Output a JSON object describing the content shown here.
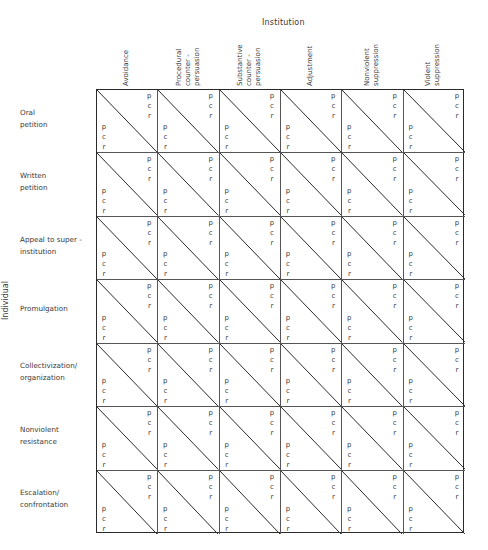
{
  "axes": {
    "top_title": "Institution",
    "left_title": "Individual"
  },
  "columns": [
    {
      "id": "avoidance",
      "label": "Avoidance"
    },
    {
      "id": "procedural-counter-persuasion",
      "label": "Procedural\ncounter -\npersuasion"
    },
    {
      "id": "substantive-counter-persuasion",
      "label": "Substantive\ncounter -\npersuasion"
    },
    {
      "id": "adjustment",
      "label": "Adjustment"
    },
    {
      "id": "nonviolent-suppression",
      "label": "Nonviolent\nsuppression"
    },
    {
      "id": "violent-suppression",
      "label": "Violent\nsuppression"
    }
  ],
  "rows": [
    {
      "id": "oral-petition",
      "label": "Oral\npetition"
    },
    {
      "id": "written-petition",
      "label": "Written\npetition"
    },
    {
      "id": "appeal-to-super-institution",
      "label": "Appeal to super -\ninstitution"
    },
    {
      "id": "promulgation",
      "label": "Promulgation"
    },
    {
      "id": "collectivization-organization",
      "label": "Collectivization/\norganization"
    },
    {
      "id": "nonviolent-resistance",
      "label": "Nonviolent\nresistance"
    },
    {
      "id": "escalation-confrontation",
      "label": "Escalation/\nconfrontation"
    }
  ],
  "cell": {
    "upper_right_letters": [
      "p",
      "c",
      "r"
    ],
    "lower_left_letters": [
      "p",
      "c",
      "r"
    ],
    "diagonal": "top-left to bottom-right"
  },
  "colors": {
    "line": "#2a2a2a",
    "text": "#3a3a3a",
    "background": "#ffffff"
  }
}
